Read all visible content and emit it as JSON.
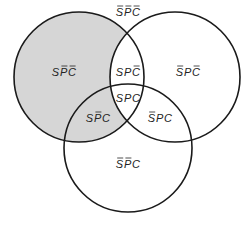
{
  "diagram": {
    "type": "venn-3",
    "sets": [
      {
        "id": "S",
        "name": "S"
      },
      {
        "id": "P",
        "name": "P"
      },
      {
        "id": "C",
        "name": "C"
      }
    ],
    "shaded_regions": [
      "SP̄C̄",
      "SP̄C"
    ],
    "colors": {
      "shade": "#d6d6d6",
      "stroke": "#1a1a1a"
    },
    "regions": [
      {
        "id": "outside",
        "label": "S̄P̄C̄",
        "letters": [
          {
            "l": "S",
            "bar": true
          },
          {
            "l": "P",
            "bar": true
          },
          {
            "l": "C",
            "bar": true
          }
        ]
      },
      {
        "id": "s-only",
        "label": "SP̄C̄",
        "letters": [
          {
            "l": "S",
            "bar": false
          },
          {
            "l": "P",
            "bar": true
          },
          {
            "l": "C",
            "bar": true
          }
        ]
      },
      {
        "id": "s-and-p",
        "label": "SPC̄",
        "letters": [
          {
            "l": "S",
            "bar": false
          },
          {
            "l": "P",
            "bar": false
          },
          {
            "l": "C",
            "bar": true
          }
        ]
      },
      {
        "id": "p-only",
        "label": "S̄PC̄",
        "letters": [
          {
            "l": "S",
            "bar": true
          },
          {
            "l": "P",
            "bar": false
          },
          {
            "l": "C",
            "bar": true
          }
        ]
      },
      {
        "id": "all",
        "label": "SPC",
        "letters": [
          {
            "l": "S",
            "bar": false
          },
          {
            "l": "P",
            "bar": false
          },
          {
            "l": "C",
            "bar": false
          }
        ]
      },
      {
        "id": "s-and-c",
        "label": "SP̄C",
        "letters": [
          {
            "l": "S",
            "bar": false
          },
          {
            "l": "P",
            "bar": true
          },
          {
            "l": "C",
            "bar": false
          }
        ]
      },
      {
        "id": "p-and-c",
        "label": "S̄PC",
        "letters": [
          {
            "l": "S",
            "bar": true
          },
          {
            "l": "P",
            "bar": false
          },
          {
            "l": "C",
            "bar": false
          }
        ]
      },
      {
        "id": "c-only",
        "label": "S̄P̄C",
        "letters": [
          {
            "l": "S",
            "bar": true
          },
          {
            "l": "P",
            "bar": true
          },
          {
            "l": "C",
            "bar": false
          }
        ]
      }
    ]
  }
}
